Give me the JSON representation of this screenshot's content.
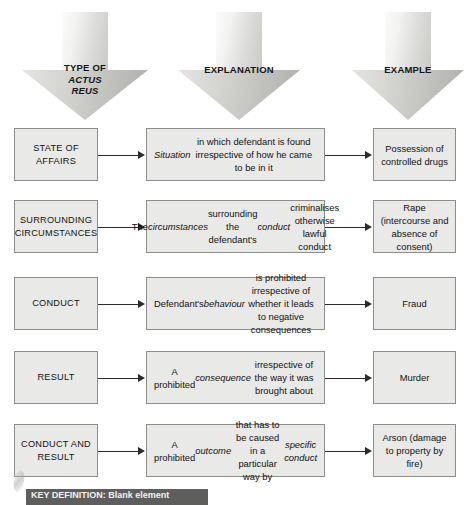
{
  "diagram": {
    "columns": [
      {
        "id": "type",
        "label_line1": "TYPE OF",
        "label_line2": "ACTUS",
        "label_line3": "REUS",
        "icon": "down-arrow-icon"
      },
      {
        "id": "explanation",
        "label_line1": "EXPLANATION",
        "label_line2": "",
        "label_line3": "",
        "icon": "down-arrow-icon"
      },
      {
        "id": "example",
        "label_line1": "EXAMPLE",
        "label_line2": "",
        "label_line3": "",
        "icon": "down-arrow-icon"
      }
    ],
    "rows": [
      {
        "category": "STATE OF AFFAIRS",
        "explanation_html": "<em>Situation</em> in which defendant is found irrespective of how he came to be in it",
        "explanation_text": "Situation in which defendant is found irrespective of how he came to be in it",
        "example_text": "Possession of controlled drugs"
      },
      {
        "category": "SURROUNDING CIRCUMSTANCES",
        "explanation_html": "The <em>circumstances</em> surrounding the defendant's <em>conduct</em> criminalises otherwise lawful conduct",
        "explanation_text": "The circumstances surrounding the defendant's conduct criminalises otherwise lawful conduct",
        "example_text": "Rape (intercourse and absence of consent)"
      },
      {
        "category": "CONDUCT",
        "explanation_html": "Defendant's <em>behaviour</em> is prohibited irrespective of whether it leads to negative consequences",
        "explanation_text": "Defendant's behaviour is prohibited irrespective of whether it leads to negative consequences",
        "example_text": "Fraud"
      },
      {
        "category": "RESULT",
        "explanation_html": "A prohibited <em>consequence</em> irrespective of the way it was brought about",
        "explanation_text": "A prohibited consequence irrespective of the way it was brought about",
        "example_text": "Murder"
      },
      {
        "category": "CONDUCT AND RESULT",
        "explanation_html": "A prohibited <em>outcome</em> that has to be caused in a particular way by <em>specific conduct</em>",
        "explanation_text": "A prohibited outcome that has to be caused in a particular way by specific conduct",
        "example_text": "Arson (damage to property by fire)"
      }
    ],
    "bottom_banner": {
      "text": "KEY DEFINITION: Blank element",
      "visible": "partially cropped at page edge"
    },
    "colors": {
      "box_fill": "#e9e9e7",
      "box_border": "#8d8d8b",
      "connector": "#2b2b2b",
      "arrow_light": "#f2f2f1",
      "arrow_dark": "#aeaeab",
      "banner_bg": "#5e5e5c",
      "page_bg": "#ffffff"
    }
  }
}
